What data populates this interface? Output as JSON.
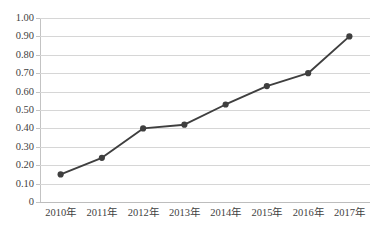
{
  "chart_data": {
    "type": "line",
    "title": "",
    "subtitle": "",
    "xlabel": "",
    "ylabel": "",
    "categories": [
      "2010年",
      "2011年",
      "2012年",
      "2013年",
      "2014年",
      "2015年",
      "2016年",
      "2017年"
    ],
    "series": [
      {
        "name": "series-1",
        "values": [
          0.15,
          0.24,
          0.4,
          0.42,
          0.53,
          0.63,
          0.7,
          0.9
        ]
      }
    ],
    "ylim": [
      0,
      1.0
    ],
    "ytick_labels": [
      "0",
      "0.10",
      "0.20",
      "0.30",
      "0.40",
      "0.50",
      "0.60",
      "0.70",
      "0.80",
      "0.90",
      "1.00"
    ],
    "ytick_values": [
      0,
      0.1,
      0.2,
      0.3,
      0.4,
      0.5,
      0.6,
      0.7,
      0.8,
      0.9,
      1.0
    ],
    "grid": true,
    "legend": false,
    "legend_position": "none",
    "marker": "circle",
    "colors": {
      "line": "#3f3f3f",
      "marker": "#3f3f3f",
      "gridline": "#d6d6d6",
      "axis": "#bdbdbd",
      "background": "#ffffff",
      "text": "#3f3f3f"
    }
  }
}
